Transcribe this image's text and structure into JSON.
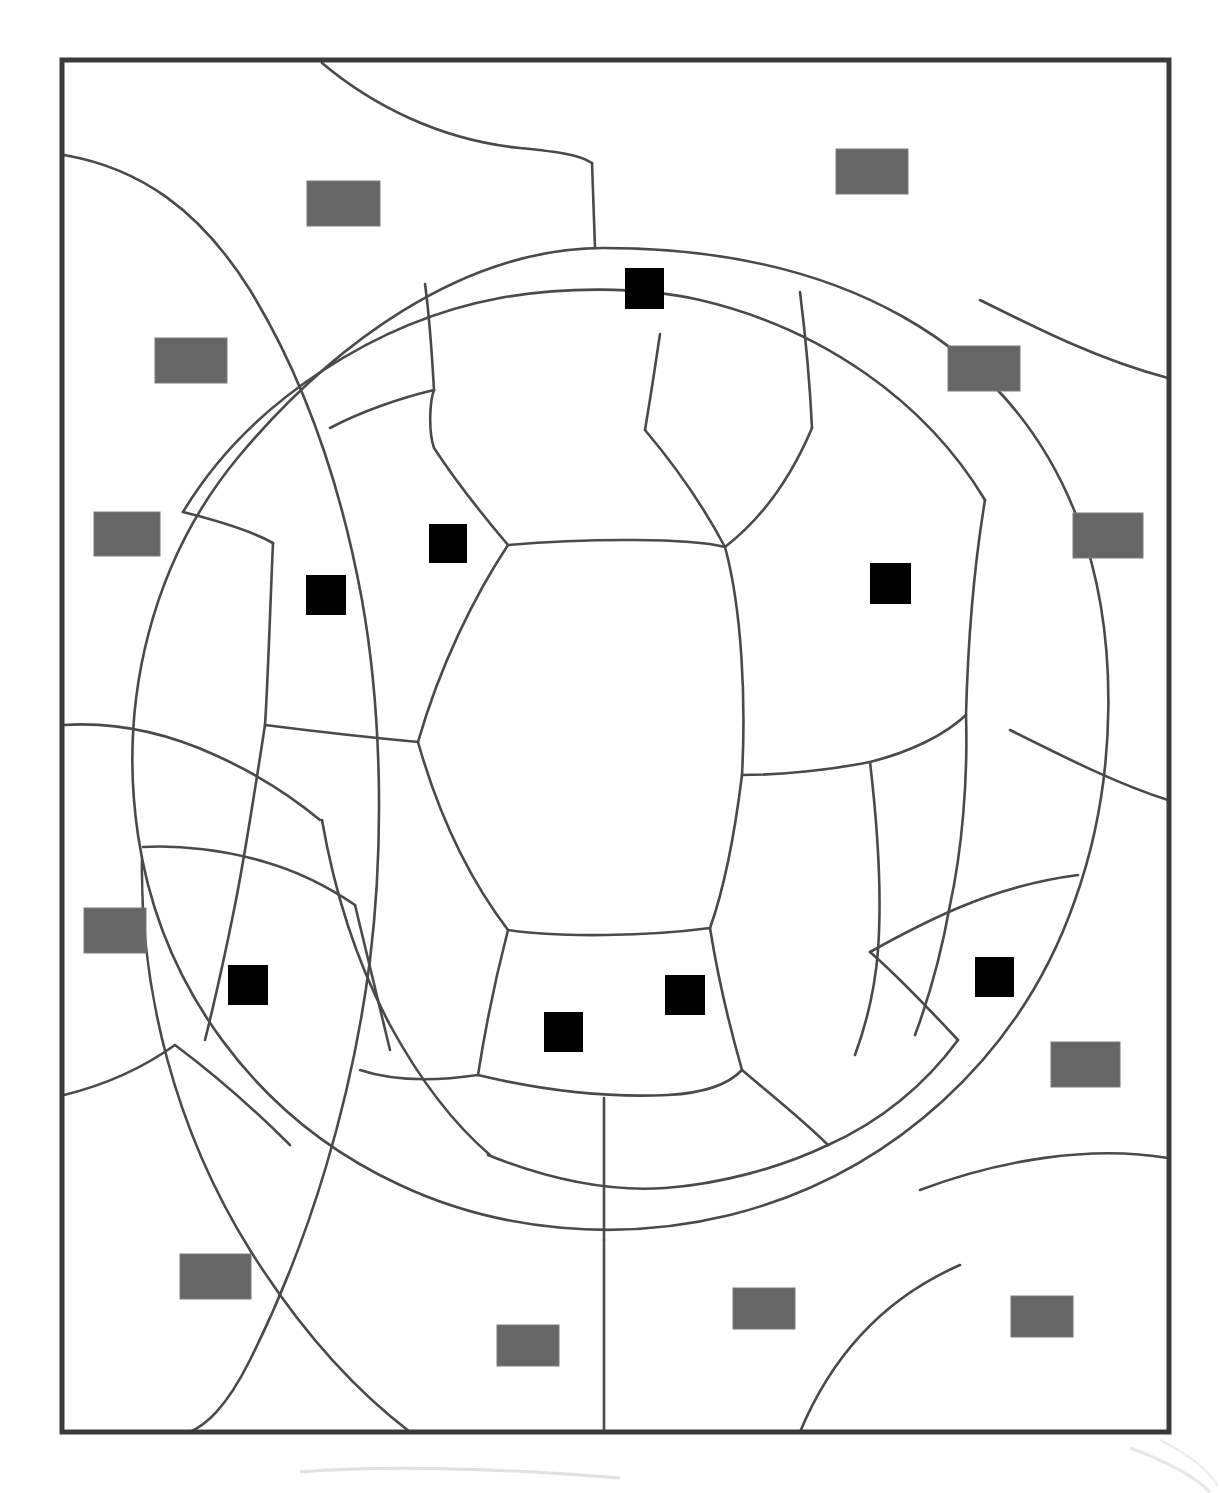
{
  "page": {
    "title": "Soccer Ball Coloring Outline",
    "width": 1220,
    "height": 1493,
    "background_color": "#ffffff"
  },
  "frame": {
    "name": "artwork-border",
    "x": 62,
    "y": 60,
    "width": 1107,
    "height": 1372,
    "stroke_color": "#3a3a3a",
    "stroke_width": 5,
    "fill": "#ffffff"
  },
  "line_art": {
    "stroke_color": "#4a4a4a",
    "stroke_width": 2.6,
    "description": "soccer-ball-panel-outlines"
  },
  "markers": {
    "gray": {
      "label": "gray-marker",
      "color": "#666666",
      "stroke_color": "#7a7a7a",
      "count": 14,
      "default_width": 72,
      "default_height": 45,
      "items": [
        {
          "name": "gray-marker-1",
          "x": 307,
          "y": 181,
          "w": 73,
          "h": 45
        },
        {
          "name": "gray-marker-2",
          "x": 836,
          "y": 149,
          "w": 72,
          "h": 45
        },
        {
          "name": "gray-marker-3",
          "x": 155,
          "y": 338,
          "w": 72,
          "h": 45
        },
        {
          "name": "gray-marker-4",
          "x": 948,
          "y": 346,
          "w": 72,
          "h": 45
        },
        {
          "name": "gray-marker-5",
          "x": 94,
          "y": 512,
          "w": 66,
          "h": 44
        },
        {
          "name": "gray-marker-6",
          "x": 1073,
          "y": 513,
          "w": 70,
          "h": 45
        },
        {
          "name": "gray-marker-7",
          "x": 84,
          "y": 908,
          "w": 62,
          "h": 45
        },
        {
          "name": "gray-marker-8",
          "x": 1051,
          "y": 1042,
          "w": 69,
          "h": 45
        },
        {
          "name": "gray-marker-9",
          "x": 180,
          "y": 1254,
          "w": 71,
          "h": 45
        },
        {
          "name": "gray-marker-10",
          "x": 733,
          "y": 1288,
          "w": 62,
          "h": 41
        },
        {
          "name": "gray-marker-11",
          "x": 1011,
          "y": 1296,
          "w": 62,
          "h": 41
        },
        {
          "name": "gray-marker-12",
          "x": 497,
          "y": 1325,
          "w": 62,
          "h": 41
        }
      ]
    },
    "black": {
      "label": "black-marker",
      "color": "#000000",
      "count": 9,
      "default_size": 38,
      "items": [
        {
          "name": "black-marker-1",
          "x": 625,
          "y": 268,
          "w": 39,
          "h": 41
        },
        {
          "name": "black-marker-2",
          "x": 429,
          "y": 524,
          "w": 38,
          "h": 39
        },
        {
          "name": "black-marker-3",
          "x": 870,
          "y": 563,
          "w": 41,
          "h": 41
        },
        {
          "name": "black-marker-4",
          "x": 306,
          "y": 575,
          "w": 40,
          "h": 40
        },
        {
          "name": "black-marker-5",
          "x": 228,
          "y": 965,
          "w": 40,
          "h": 40
        },
        {
          "name": "black-marker-6",
          "x": 975,
          "y": 957,
          "w": 39,
          "h": 40
        },
        {
          "name": "black-marker-7",
          "x": 665,
          "y": 975,
          "w": 40,
          "h": 40
        },
        {
          "name": "black-marker-8",
          "x": 544,
          "y": 1012,
          "w": 39,
          "h": 40
        }
      ]
    }
  },
  "artifact": {
    "name": "scan-edge-smudge",
    "visible": true,
    "color": "#d8d8d8"
  }
}
